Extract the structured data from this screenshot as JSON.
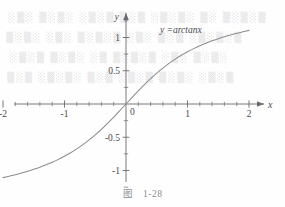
{
  "figure": {
    "caption_label": "图",
    "caption_number": "1-28",
    "curve_label": "y =arctanx",
    "curve_color": "#8d8d92",
    "axis_color": "#6b6b70",
    "text_color": "#4a4a4e"
  },
  "background_bleed": {
    "note": "faint mirrored text bleeding through from reverse of scanned page",
    "rows": [
      "░▒░ ▒░▒░ ░▒░▒ ▒░▒ ░▒░▒░ ▒░ ▒░▒░▒",
      "▒░▒░ ░▒░ ▒░▒░▒ ░▒░ ▒░▒ ░▒░▒░▒",
      "░▒░▒ ▒░▒░ ░▒ ▒░▒░▒ ░▒░ ▒░▒░",
      "▒░▒ ░▒░▒░ ▒░▒ ░▒░▒ ▒░▒░ ░▒░▒"
    ]
  },
  "chart_data": {
    "type": "line",
    "title": "",
    "subtitle": "",
    "xlabel": "x",
    "ylabel": "y",
    "xlim": [
      -2.0,
      2.0
    ],
    "ylim": [
      -1.25,
      1.25
    ],
    "grid": false,
    "legend_position": "inside-top-right",
    "axis_style": "centered-cross-with-arrows",
    "x_ticks_major": [
      -2,
      -1,
      0,
      1,
      2
    ],
    "x_tick_labels": [
      "-2",
      "-1",
      "0",
      "1",
      "2"
    ],
    "x_tick_minor_step": 0.2,
    "y_ticks_major": [
      -1,
      -0.5,
      0.5,
      1
    ],
    "y_tick_labels": [
      "-1",
      "-0.5",
      "0.5",
      "1"
    ],
    "y_origin_label": "0",
    "y_tick_minor_step": 0.25,
    "series": [
      {
        "name": "y =arctanx",
        "expression": "y = arctan(x)",
        "color": "#8d8d92",
        "x": [
          -2.0,
          -1.9,
          -1.8,
          -1.7,
          -1.6,
          -1.5,
          -1.4,
          -1.3,
          -1.2,
          -1.1,
          -1.0,
          -0.9,
          -0.8,
          -0.7,
          -0.6,
          -0.5,
          -0.4,
          -0.3,
          -0.2,
          -0.1,
          0.0,
          0.1,
          0.2,
          0.3,
          0.4,
          0.5,
          0.6,
          0.7,
          0.8,
          0.9,
          1.0,
          1.1,
          1.2,
          1.3,
          1.4,
          1.5,
          1.6,
          1.7,
          1.8,
          1.9,
          2.0
        ],
        "y": [
          -1.107,
          -1.086,
          -1.064,
          -1.039,
          -1.012,
          -0.983,
          -0.951,
          -0.915,
          -0.876,
          -0.833,
          -0.785,
          -0.733,
          -0.675,
          -0.611,
          -0.54,
          -0.464,
          -0.381,
          -0.291,
          -0.197,
          -0.1,
          0.0,
          0.1,
          0.197,
          0.291,
          0.381,
          0.464,
          0.54,
          0.611,
          0.675,
          0.733,
          0.785,
          0.833,
          0.876,
          0.915,
          0.951,
          0.983,
          1.012,
          1.039,
          1.064,
          1.086,
          1.107
        ]
      }
    ]
  }
}
